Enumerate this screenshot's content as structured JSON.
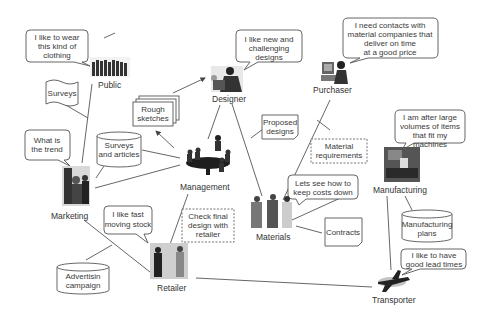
{
  "actors": {
    "public": {
      "label": "Public",
      "speech": [
        "I like to wear",
        "this kind of",
        "clothing"
      ]
    },
    "designer": {
      "label": "Designer",
      "speech": [
        "I like new and",
        "challenging",
        "designs"
      ]
    },
    "purchaser": {
      "label": "Purchaser",
      "speech": [
        "I need contacts with",
        "material companies that",
        "deliver on time",
        "at a good price"
      ]
    },
    "marketing": {
      "label": "Marketing",
      "speech": [
        "What is",
        "the trend"
      ]
    },
    "management": {
      "label": "Management"
    },
    "manufacturing": {
      "label": "Manufacturing",
      "speech": [
        "I am after large",
        "volumes of items",
        "that fit my",
        "machines"
      ]
    },
    "materials": {
      "label": "Materials",
      "speech": [
        "Lets see how to",
        "keep costs down"
      ]
    },
    "retailer": {
      "label": "Retailer",
      "speech": [
        "I like fast",
        "moving stock"
      ]
    },
    "transporter": {
      "label": "Transporter",
      "speech": [
        "I like to have",
        "good lead times"
      ]
    }
  },
  "artifacts": {
    "surveys": [
      "Surveys"
    ],
    "rough_sketches": [
      "Rough",
      "sketches"
    ],
    "surveys_articles": [
      "Surveys",
      "and articles"
    ],
    "proposed_designs": [
      "Proposed",
      "designs"
    ],
    "material_requirements": [
      "Material",
      "requirements"
    ],
    "check_final_design": [
      "Check final",
      "design with",
      "retailer"
    ],
    "contracts": [
      "Contracts"
    ],
    "manufacturing_plans": [
      "Manufacturing",
      "plans"
    ],
    "advertising_campaign": [
      "Advertisin",
      "campaign"
    ]
  }
}
